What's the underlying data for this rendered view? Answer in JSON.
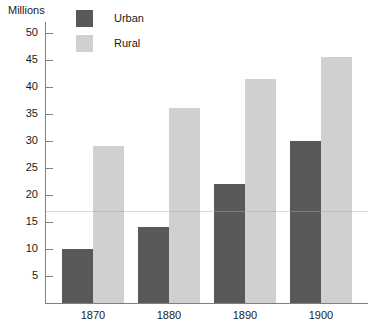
{
  "chart_data": {
    "type": "bar",
    "title": "",
    "xlabel": "",
    "ylabel": "Millions",
    "categories": [
      "1870",
      "1880",
      "1890",
      "1900"
    ],
    "series": [
      {
        "name": "Urban",
        "color": "#595959",
        "values": [
          10,
          14,
          22,
          30
        ]
      },
      {
        "name": "Rural",
        "color": "#d0d0d0",
        "values": [
          29,
          36,
          41.5,
          45.5
        ]
      }
    ],
    "ylim": [
      0,
      52
    ],
    "yticks": [
      5,
      10,
      15,
      20,
      25,
      30,
      35,
      40,
      45,
      50
    ],
    "ytick_labels": [
      "5",
      "10",
      "15",
      "20",
      "25",
      "30",
      "35",
      "40",
      "45",
      "50"
    ],
    "grid": false,
    "legend_position": "top-left-inside",
    "bar_style": "grouped-adjacent"
  },
  "axis": {
    "y_title": "Millions"
  },
  "legend": {
    "entries": [
      {
        "label": "Urban",
        "color": "#595959"
      },
      {
        "label": "Rural",
        "color": "#d0d0d0"
      }
    ]
  }
}
